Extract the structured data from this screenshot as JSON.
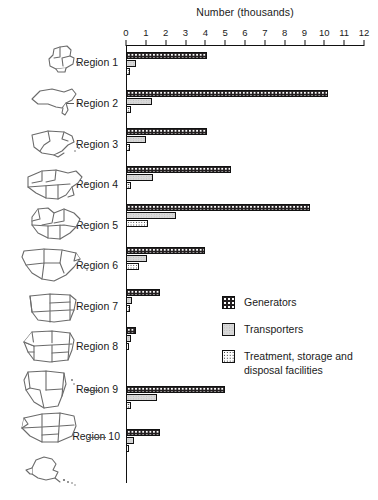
{
  "chart_data": {
    "type": "bar",
    "orientation": "horizontal",
    "title": "Number (thousands)",
    "xlabel": "Number (thousands)",
    "ylabel": "",
    "xlim": [
      0,
      12
    ],
    "xticks": [
      0,
      1,
      2,
      3,
      4,
      5,
      6,
      7,
      8,
      9,
      10,
      11,
      12
    ],
    "xticklabels": [
      "0",
      "1",
      "2",
      "3",
      "4",
      "5",
      "6",
      "7",
      "8",
      "9",
      "10",
      "11",
      "12"
    ],
    "grid": false,
    "legend_position": "center-right",
    "categories": [
      "Region 1",
      "Region 2",
      "Region 3",
      "Region 4",
      "Region 5",
      "Region 6",
      "Region 7",
      "Region 8",
      "Region 9",
      "Region 10"
    ],
    "series": [
      {
        "name": "Generators",
        "color": "#231f20",
        "pattern": "dark-checker",
        "values": [
          4.1,
          10.2,
          4.1,
          5.3,
          9.3,
          4.0,
          1.7,
          0.5,
          5.0,
          1.7
        ]
      },
      {
        "name": "Transporters",
        "color": "#d8d8d8",
        "pattern": "light-stipple",
        "values": [
          0.5,
          1.3,
          1.0,
          1.35,
          2.5,
          1.05,
          0.3,
          0.25,
          1.55,
          0.4
        ]
      },
      {
        "name": "Treatment, storage and disposal facilities",
        "color": "#ffffff",
        "pattern": "fine-dot",
        "values": [
          0.2,
          0.25,
          0.2,
          0.25,
          1.1,
          0.65,
          0.2,
          0.15,
          0.25,
          0.15
        ]
      }
    ]
  },
  "axis": {
    "title": "Number (thousands)"
  },
  "legend": {
    "items": [
      {
        "label": "Generators",
        "swatch": "generators-swatch"
      },
      {
        "label": "Transporters",
        "swatch": "transporters-swatch"
      },
      {
        "label": "Treatment, storage and\ndisposal facilities",
        "swatch": "tsd-swatch"
      }
    ]
  },
  "regions": [
    {
      "label": "Region 1",
      "map": "new-england-map"
    },
    {
      "label": "Region 2",
      "map": "new-york-new-jersey-map"
    },
    {
      "label": "Region 3",
      "map": "mid-atlantic-map"
    },
    {
      "label": "Region 4",
      "map": "southeast-map"
    },
    {
      "label": "Region 5",
      "map": "great-lakes-map"
    },
    {
      "label": "Region 6",
      "map": "south-central-map"
    },
    {
      "label": "Region 7",
      "map": "midwest-map"
    },
    {
      "label": "Region 8",
      "map": "mountain-map"
    },
    {
      "label": "Region 9",
      "map": "pacific-southwest-map"
    },
    {
      "label": "Region 10",
      "map": "pacific-northwest-map"
    }
  ],
  "inset_map": {
    "name": "alaska-map"
  }
}
